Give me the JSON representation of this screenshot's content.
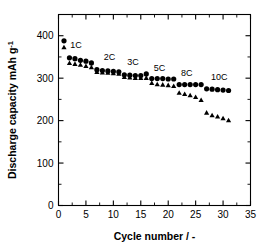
{
  "figure": {
    "background_color": "#ffffff",
    "marker_color": "#000000"
  },
  "axes": {
    "x": {
      "label": "Cycle number / -",
      "ticks": [
        0,
        5,
        10,
        15,
        20,
        25,
        30,
        35
      ],
      "min": 0,
      "max": 35
    },
    "y": {
      "label_main": "Discharge capacity  mAh g",
      "label_sup": "-1",
      "ticks": [
        0,
        100,
        200,
        300,
        400
      ],
      "min": 0,
      "max": 450
    }
  },
  "chart_data": {
    "type": "scatter",
    "title": "",
    "xlabel": "Cycle number / -",
    "ylabel": "Discharge capacity  mAh g-1",
    "xlim": [
      0,
      35
    ],
    "ylim": [
      0,
      450
    ],
    "grid": false,
    "legend_position": "none",
    "annotations": [
      {
        "text": "1C",
        "x": 3.2,
        "y": 372
      },
      {
        "text": "2C",
        "x": 9.3,
        "y": 342
      },
      {
        "text": "3C",
        "x": 13.6,
        "y": 330
      },
      {
        "text": "5C",
        "x": 18.4,
        "y": 318
      },
      {
        "text": "8C",
        "x": 23.4,
        "y": 305
      },
      {
        "text": "10C",
        "x": 29.3,
        "y": 295
      }
    ],
    "series": [
      {
        "name": "circles",
        "marker": "circle",
        "x": [
          1,
          2,
          3,
          4,
          5,
          6,
          7,
          8,
          9,
          10,
          11,
          12,
          13,
          14,
          15,
          16,
          17,
          18,
          19,
          20,
          21,
          22,
          23,
          24,
          25,
          26,
          27,
          28,
          29,
          30,
          31
        ],
        "values": [
          388,
          348,
          346,
          342,
          340,
          336,
          320,
          318,
          317,
          316,
          315,
          308,
          307,
          306,
          306,
          310,
          299,
          299,
          299,
          298,
          298,
          285,
          285,
          285,
          285,
          285,
          275,
          274,
          273,
          272,
          271
        ]
      },
      {
        "name": "triangles",
        "marker": "triangle",
        "x": [
          1,
          2,
          3,
          4,
          5,
          6,
          7,
          8,
          9,
          10,
          11,
          12,
          13,
          14,
          15,
          16,
          17,
          18,
          19,
          20,
          21,
          22,
          23,
          24,
          25,
          26,
          27,
          28,
          29,
          30,
          31
        ],
        "values": [
          372,
          335,
          333,
          331,
          328,
          325,
          314,
          313,
          312,
          311,
          310,
          302,
          301,
          300,
          300,
          300,
          288,
          285,
          284,
          283,
          281,
          265,
          262,
          259,
          255,
          248,
          218,
          212,
          209,
          205,
          200
        ]
      }
    ]
  }
}
